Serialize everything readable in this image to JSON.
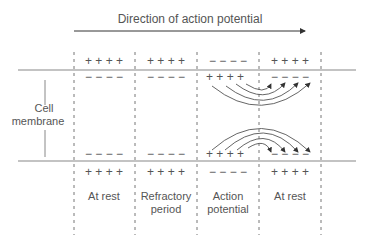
{
  "title": "Direction of action potential",
  "side_label": {
    "line1": "Cell",
    "line2": "membrane"
  },
  "segments": [
    {
      "label1": "At rest",
      "label2": "",
      "outside_top": "+ + + +",
      "inside_top": "− − − −",
      "inside_bottom": "− − − −",
      "outside_bottom": "+ + + +"
    },
    {
      "label1": "Refractory",
      "label2": "period",
      "outside_top": "+ + + +",
      "inside_top": "− − − −",
      "inside_bottom": "− − − −",
      "outside_bottom": "+ + + +"
    },
    {
      "label1": "Action",
      "label2": "potential",
      "outside_top": "− − − −",
      "inside_top": "+ + + +",
      "inside_bottom": "+ + + +",
      "outside_bottom": "− − − −"
    },
    {
      "label1": "At rest",
      "label2": "",
      "outside_top": "+ + + +",
      "inside_top": "− − − −",
      "inside_bottom": "− − − −",
      "outside_bottom": "+ + + +"
    }
  ],
  "colors": {
    "line": "#888888",
    "text": "#555555",
    "arrow": "#333333"
  }
}
